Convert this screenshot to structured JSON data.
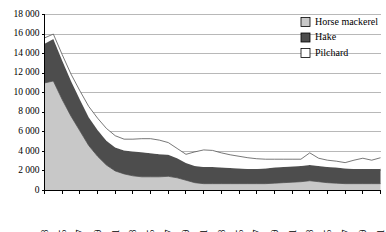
{
  "chart_data": {
    "type": "area",
    "stacked": true,
    "title": "",
    "subtitle": "",
    "xlabel": "",
    "ylabel": "",
    "grid": true,
    "legend_position": "top-right",
    "ylim": [
      0,
      18000
    ],
    "y_ticks": [
      0,
      2000,
      4000,
      6000,
      8000,
      10000,
      12000,
      14000,
      16000,
      18000
    ],
    "y_tick_labels": [
      "0",
      "2 000",
      "4 000",
      "6 000",
      "8 000",
      "10 000",
      "12 000",
      "14 000",
      "16 000",
      "18 000"
    ],
    "x": [
      1963,
      1964,
      1965,
      1966,
      1967,
      1968,
      1969,
      1970,
      1971,
      1972,
      1973,
      1974,
      1975,
      1976,
      1977,
      1978,
      1979,
      1980,
      1981,
      1982,
      1983,
      1984,
      1985,
      1986,
      1987,
      1988,
      1989,
      1990,
      1991,
      1992,
      1993,
      1994,
      1995,
      1996,
      1997,
      1998,
      1999,
      2000,
      2001
    ],
    "x_tick_labels": [
      "1963",
      "1965",
      "1967",
      "1969",
      "1971",
      "1973",
      "1975",
      "1977",
      "1979",
      "1981",
      "1983",
      "1985",
      "1987",
      "1989",
      "1991",
      "1993",
      "1995",
      "1997",
      "1999",
      "2001"
    ],
    "x_tick_values": [
      1963,
      1965,
      1967,
      1969,
      1971,
      1973,
      1975,
      1977,
      1979,
      1981,
      1983,
      1985,
      1987,
      1989,
      1991,
      1993,
      1995,
      1997,
      1999,
      2001
    ],
    "stack_order_bottom_to_top": [
      "Horse mackerel",
      "Hake",
      "Pilchard"
    ],
    "series": [
      {
        "name": "Horse mackerel",
        "color": "#c8c8c8",
        "values": [
          11000,
          11200,
          9300,
          7600,
          6100,
          4600,
          3500,
          2600,
          2000,
          1700,
          1500,
          1400,
          1400,
          1400,
          1450,
          1300,
          1050,
          800,
          700,
          700,
          700,
          700,
          700,
          700,
          700,
          700,
          750,
          800,
          850,
          900,
          1000,
          900,
          800,
          750,
          700,
          700,
          700,
          700,
          700
        ]
      },
      {
        "name": "Hake",
        "color": "#4d4d4d",
        "values": [
          4000,
          4300,
          4000,
          3600,
          3200,
          2900,
          2700,
          2500,
          2400,
          2400,
          2500,
          2500,
          2400,
          2300,
          2200,
          2000,
          1750,
          1700,
          1700,
          1700,
          1650,
          1600,
          1550,
          1500,
          1500,
          1550,
          1600,
          1600,
          1600,
          1600,
          1600,
          1600,
          1600,
          1600,
          1550,
          1500,
          1500,
          1500,
          1500
        ]
      },
      {
        "name": "Pilchard",
        "color": "#ffffff",
        "values": [
          600,
          500,
          600,
          700,
          900,
          1100,
          1200,
          1250,
          1200,
          1150,
          1250,
          1400,
          1500,
          1450,
          1250,
          1000,
          900,
          1450,
          1750,
          1700,
          1500,
          1350,
          1250,
          1150,
          1050,
          950,
          850,
          800,
          750,
          700,
          1250,
          800,
          700,
          650,
          600,
          900,
          1100,
          900,
          1150
        ]
      }
    ],
    "totals": [
      15600,
      16000,
      13900,
      11900,
      10200,
      8600,
      7400,
      6350,
      5600,
      5250,
      5250,
      5300,
      5300,
      5150,
      4900,
      4300,
      3700,
      3950,
      4150,
      4100,
      3850,
      3650,
      3500,
      3350,
      3250,
      3200,
      3200,
      3200,
      3200,
      3200,
      3850,
      3300,
      3100,
      3000,
      2850,
      3100,
      3300,
      3100,
      3350
    ]
  },
  "legend": {
    "items": [
      {
        "label": "Horse mackerel",
        "color": "#c8c8c8"
      },
      {
        "label": "Hake",
        "color": "#4d4d4d"
      },
      {
        "label": "Pilchard",
        "color": "#ffffff"
      }
    ]
  }
}
